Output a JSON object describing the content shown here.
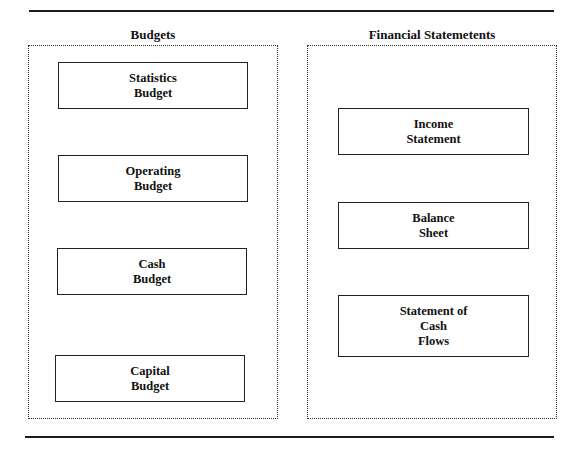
{
  "diagram": {
    "panels": [
      {
        "title": "Budgets",
        "nodes": [
          {
            "lines": [
              "Statistics",
              "Budget"
            ]
          },
          {
            "lines": [
              "Operating",
              "Budget"
            ]
          },
          {
            "lines": [
              "Cash",
              "Budget"
            ]
          },
          {
            "lines": [
              "Capital",
              "Budget"
            ]
          }
        ]
      },
      {
        "title": "Financial Statemetents",
        "nodes": [
          {
            "lines": [
              "Income",
              "Statement"
            ]
          },
          {
            "lines": [
              "Balance",
              "Sheet"
            ]
          },
          {
            "lines": [
              "Statement of",
              "Cash",
              "Flows"
            ]
          }
        ]
      }
    ]
  }
}
